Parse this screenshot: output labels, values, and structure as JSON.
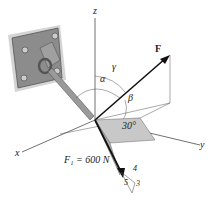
{
  "diagram": {
    "type": "3D force vector diagram",
    "axes": {
      "x": "x",
      "y": "y",
      "z": "z"
    },
    "force_F": {
      "label": "F"
    },
    "angles": {
      "alpha": "α",
      "beta": "β",
      "gamma": "γ",
      "inclination": "30°"
    },
    "force_F1": {
      "label": "F₁ = 600 N"
    },
    "slope_triangle": {
      "side_a": "4",
      "side_b": "3",
      "hypotenuse": "5"
    }
  }
}
